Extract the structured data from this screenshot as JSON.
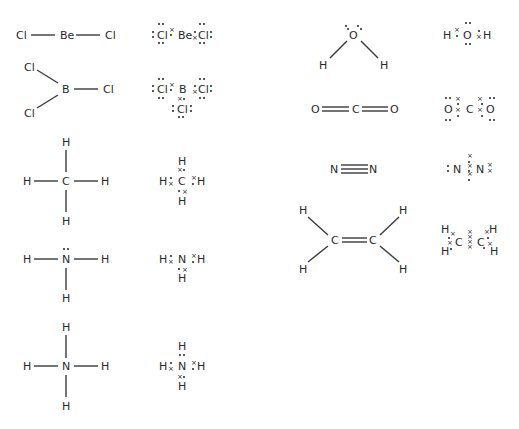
{
  "diagram": {
    "title": "",
    "molecules": [
      {
        "id": "BeCl2",
        "structural": {
          "atoms": [
            "Cl",
            "Be",
            "Cl"
          ]
        },
        "dot_cross": {
          "atoms": [
            "Cl",
            "Be",
            "Cl"
          ]
        }
      },
      {
        "id": "BCl3",
        "structural": {
          "atoms": [
            "Cl",
            "B",
            "Cl",
            "Cl"
          ]
        },
        "dot_cross": {
          "atoms": [
            "Cl",
            "B",
            "Cl",
            "Cl"
          ]
        }
      },
      {
        "id": "CH4",
        "structural": {
          "atoms": [
            "H",
            "H",
            "C",
            "H",
            "H"
          ]
        },
        "dot_cross": {
          "atoms": [
            "H",
            "H",
            "C",
            "H",
            "H"
          ]
        }
      },
      {
        "id": "NH3",
        "structural": {
          "atoms": [
            "H",
            "N",
            "H",
            "H"
          ]
        },
        "dot_cross": {
          "atoms": [
            "H",
            "N",
            "H",
            "H"
          ]
        }
      },
      {
        "id": "NH4+",
        "structural": {
          "atoms": [
            "H",
            "H",
            "N",
            "H",
            "H"
          ]
        },
        "dot_cross": {
          "atoms": [
            "H",
            "H",
            "N",
            "H",
            "H"
          ]
        }
      },
      {
        "id": "H2O",
        "structural": {
          "atoms": [
            "O",
            "H",
            "H"
          ]
        },
        "dot_cross": {
          "atoms": [
            "H",
            "O",
            "H"
          ]
        }
      },
      {
        "id": "CO2",
        "structural": {
          "atoms": [
            "O",
            "C",
            "O"
          ]
        },
        "dot_cross": {
          "atoms": [
            "O",
            "C",
            "O"
          ]
        }
      },
      {
        "id": "N2",
        "structural": {
          "atoms": [
            "N",
            "N"
          ]
        },
        "dot_cross": {
          "atoms": [
            "N",
            "N"
          ]
        }
      },
      {
        "id": "C2H4",
        "structural": {
          "atoms": [
            "H",
            "H",
            "C",
            "C",
            "H",
            "H"
          ]
        },
        "dot_cross": {
          "atoms": [
            "H",
            "H",
            "C",
            "C",
            "H",
            "H"
          ]
        }
      }
    ],
    "colors": {
      "ink": "#2a2a2a",
      "background": "#ffffff"
    }
  }
}
